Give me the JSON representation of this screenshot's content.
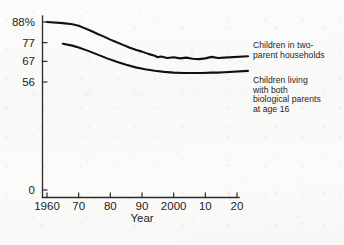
{
  "chart_data": {
    "type": "line",
    "title": "",
    "subtitle": "",
    "xlabel": "Year",
    "ylabel": "",
    "grid": false,
    "legend_position": "right-inline",
    "xlim": [
      1960,
      2020
    ],
    "ylim": [
      0,
      88
    ],
    "x_tick_values": [
      1960,
      1970,
      1980,
      1990,
      2000,
      2010,
      2020
    ],
    "x_tick_labels": [
      "1960",
      "70",
      "80",
      "90",
      "2000",
      "10",
      "20"
    ],
    "y_tick_values": [
      0,
      56,
      67,
      77,
      88
    ],
    "y_tick_labels": [
      "0",
      "56",
      "67",
      "77",
      "88%"
    ],
    "series": [
      {
        "name": "Children in two-parent households",
        "label_text": "Children in two-\nparent households",
        "color": "#111111",
        "x": [
          1960,
          1965,
          1968,
          1970,
          1972,
          1974,
          1976,
          1978,
          1980,
          1982,
          1984,
          1986,
          1988,
          1990,
          1992,
          1994,
          1995,
          1996,
          1998,
          2000,
          2002,
          2004,
          2006,
          2008,
          2010,
          2012,
          2014,
          2016
        ],
        "values": [
          88.0,
          87.4,
          86.8,
          86.0,
          84.6,
          83.2,
          81.6,
          80.2,
          78.6,
          77.2,
          75.8,
          74.4,
          73.2,
          72.2,
          71.0,
          70.0,
          69.2,
          69.6,
          68.8,
          69.2,
          68.6,
          69.0,
          68.4,
          68.2,
          68.6,
          69.4,
          68.8,
          69.0
        ]
      },
      {
        "name": "Children living with both biological parents at age 16",
        "label_text": "Children living\nwith both\nbiological parents\nat age 16",
        "color": "#111111",
        "x": [
          1965,
          1968,
          1970,
          1973,
          1976,
          1979,
          1982,
          1985,
          1988,
          1991,
          1994,
          1997,
          2000,
          2003,
          2006,
          2009,
          2012,
          2014,
          2016
        ],
        "values": [
          76.4,
          75.4,
          74.4,
          72.6,
          70.6,
          68.6,
          66.8,
          65.2,
          63.8,
          62.8,
          62.0,
          61.4,
          61.0,
          60.8,
          60.8,
          60.8,
          61.0,
          61.0,
          61.2
        ]
      }
    ]
  },
  "axis": {
    "x_title": "Year"
  }
}
